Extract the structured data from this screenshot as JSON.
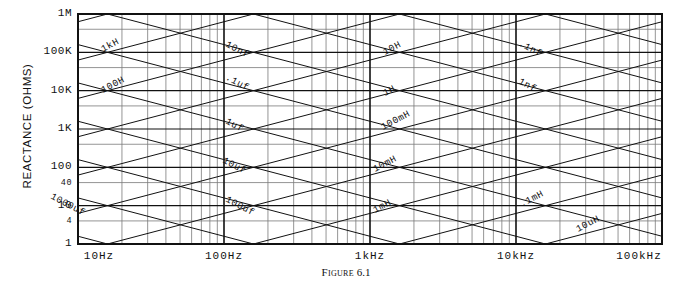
{
  "figure": {
    "caption_label": "Figure",
    "caption_number": "6.1"
  },
  "axes": {
    "y_title": "REACTANCE  (OHMS)",
    "y_ticks": [
      "1M",
      "100K",
      "10K",
      "1K",
      "100",
      "40",
      "10",
      "4",
      "1"
    ],
    "x_ticks": [
      "10Hz",
      "100Hz",
      "1kHz",
      "10kHz",
      "100kHz"
    ]
  },
  "colors": {
    "ink": "#111111",
    "grid_minor": "#7a7a7a",
    "grid_major": "#111111",
    "background": "#ffffff"
  },
  "chart_data": {
    "type": "line",
    "xlabel": "",
    "ylabel": "REACTANCE  (OHMS)",
    "xscale": "log",
    "yscale": "log",
    "xlim": [
      10,
      100000
    ],
    "ylim": [
      1,
      1000000
    ],
    "x_tick_labels": [
      "10Hz",
      "100Hz",
      "1kHz",
      "10kHz",
      "100kHz"
    ],
    "x_tick_values": [
      10,
      100,
      1000,
      10000,
      100000
    ],
    "y_tick_labels": [
      "1M",
      "100K",
      "10K",
      "1K",
      "100",
      "40",
      "10",
      "4",
      "1"
    ],
    "y_tick_values": [
      1000000,
      100000,
      10000,
      1000,
      100,
      40,
      10,
      4,
      1
    ],
    "grid": true,
    "legend": "inline-labels",
    "series": [
      {
        "name": "1kH",
        "kind": "inductor",
        "slope": 1,
        "value_henries": 1000,
        "label": "1kH",
        "label_x": 103,
        "label_y": 52,
        "label_rot": -28
      },
      {
        "name": "100H",
        "kind": "inductor",
        "slope": 1,
        "value_henries": 100,
        "label": "100H",
        "label_x": 103,
        "label_y": 93,
        "label_rot": -28
      },
      {
        "name": "10H",
        "kind": "inductor",
        "slope": 1,
        "value_henries": 10,
        "label": "10H",
        "label_x": 385,
        "label_y": 55,
        "label_rot": -28
      },
      {
        "name": "1H",
        "kind": "inductor",
        "slope": 1,
        "value_henries": 1,
        "label": "1H",
        "label_x": 385,
        "label_y": 96,
        "label_rot": -28
      },
      {
        "name": "100mH",
        "kind": "inductor",
        "slope": 1,
        "value_henries": 0.1,
        "label": "100mH",
        "label_x": 383,
        "label_y": 130,
        "label_rot": -28
      },
      {
        "name": "10mH",
        "kind": "inductor",
        "slope": 1,
        "value_henries": 0.01,
        "label": "10mH",
        "label_x": 375,
        "label_y": 172,
        "label_rot": -28
      },
      {
        "name": "1mH",
        "kind": "inductor",
        "slope": 1,
        "value_henries": 0.001,
        "label": "1mH",
        "label_x": 375,
        "label_y": 213,
        "label_rot": -28
      },
      {
        "name": ".1mH",
        "kind": "inductor",
        "slope": 1,
        "value_henries": 0.0001,
        "label": ".1mH",
        "label_x": 522,
        "label_y": 207,
        "label_rot": -28
      },
      {
        "name": "10uH",
        "kind": "inductor",
        "slope": 1,
        "value_henries": 1e-05,
        "label": "10uH",
        "label_x": 578,
        "label_y": 232,
        "label_rot": -28
      },
      {
        "name": "1000uf",
        "kind": "capacitor",
        "slope": -1,
        "value_farads": 0.001,
        "label": "1000uf",
        "label_x": 50,
        "label_y": 198,
        "label_rot": 28
      },
      {
        "name": "100uf",
        "kind": "capacitor",
        "slope": -1,
        "value_farads": 0.0001,
        "label": "100uf",
        "label_x": 225,
        "label_y": 201,
        "label_rot": 28
      },
      {
        "name": "10uf",
        "kind": "capacitor",
        "slope": -1,
        "value_farads": 1e-05,
        "label": "10uf",
        "label_x": 222,
        "label_y": 162,
        "label_rot": 28
      },
      {
        "name": "1uf",
        "kind": "capacitor",
        "slope": -1,
        "value_farads": 1e-06,
        "label": "1uf",
        "label_x": 225,
        "label_y": 123,
        "label_rot": 28
      },
      {
        "name": ".1uf",
        "kind": "capacitor",
        "slope": -1,
        "value_farads": 1e-07,
        "label": ".1uf",
        "label_x": 225,
        "label_y": 79,
        "label_rot": 28
      },
      {
        "name": "10nf",
        "kind": "capacitor",
        "slope": -1,
        "value_farads": 1e-08,
        "label": "10nf",
        "label_x": 225,
        "label_y": 46,
        "label_rot": 28
      },
      {
        "name": "1nf",
        "kind": "capacitor",
        "slope": -1,
        "value_farads": 1e-09,
        "label": "1nf",
        "label_x": 518,
        "label_y": 83,
        "label_rot": 28
      },
      {
        "name": ".1nf",
        "kind": "capacitor",
        "slope": -1,
        "value_farads": 1e-10,
        "label": ".1nf",
        "label_x": 518,
        "label_y": 45,
        "label_rot": 28
      }
    ]
  }
}
